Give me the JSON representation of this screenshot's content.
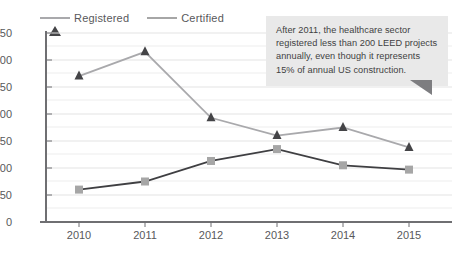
{
  "chart_data": {
    "type": "line",
    "title": "",
    "subtitle": "",
    "xlabel": "",
    "ylabel": "",
    "categories": [
      "2010",
      "2011",
      "2012",
      "2013",
      "2014",
      "2015"
    ],
    "x": [
      2010,
      2011,
      2012,
      2013,
      2014,
      2015
    ],
    "ylim": [
      0,
      350
    ],
    "yticks": [
      0,
      50,
      100,
      150,
      200,
      250,
      300,
      350
    ],
    "ytick_labels": [
      "0",
      "50",
      "100",
      "150",
      "200",
      "250",
      "300",
      "350"
    ],
    "grid": true,
    "grid_axis": "y",
    "legend_position": "top-left",
    "series": [
      {
        "name": "Registered",
        "marker": "triangle",
        "color": "#444447",
        "line_color": "#a9a9ac",
        "values": [
          270,
          315,
          193,
          160,
          175,
          138
        ]
      },
      {
        "name": "Certified",
        "marker": "square",
        "color": "#a6a6a6",
        "line_color": "#3f3f42",
        "values": [
          60,
          75,
          113,
          135,
          105,
          97
        ]
      }
    ],
    "annotations": [
      {
        "id": "healthcare-note",
        "text": "After 2011, the healthcare sector registered less than 200 LEED projects annually, even though it represents 15% of annual US construction.",
        "lines": [
          "After 2011, the healthcare sector",
          "registered less than 200 LEED projects",
          "annually, even though it represents",
          "15% of annual US construction."
        ],
        "background": "#e9e9e9",
        "text_color": "#3f3f42"
      }
    ]
  },
  "colors": {
    "axis": "#6f6f72",
    "grid": "#e3e3e3",
    "tick_text": "#58585b",
    "registered_marker": "#444447",
    "registered_line": "#a9a9ac",
    "certified_marker": "#a6a6a6",
    "certified_line": "#3f3f42",
    "callout_bg": "#e9e9e9",
    "callout_tail": "#7d7d80"
  },
  "legend": {
    "items": [
      {
        "label": "Registered",
        "marker": "triangle-marker"
      },
      {
        "label": "Certified",
        "marker": "square-marker"
      }
    ]
  }
}
